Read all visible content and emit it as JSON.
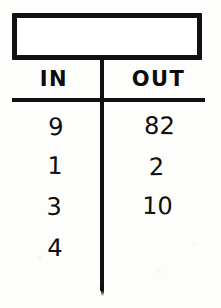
{
  "worksheet": {
    "kind": "in-out-function-table",
    "rule_box": {
      "name": "rule-box",
      "text": ""
    },
    "table": {
      "columns": [
        "IN",
        "OUT"
      ],
      "rows": [
        {
          "in": "9",
          "out": "82"
        },
        {
          "in": "1",
          "out": "2"
        },
        {
          "in": "3",
          "out": "10"
        },
        {
          "in": "4",
          "out": ""
        }
      ]
    },
    "colors": {
      "ink": "#111111",
      "paper": "#fdfdfc"
    }
  },
  "chart_data": {
    "type": "table",
    "title": "",
    "columns": [
      "IN",
      "OUT"
    ],
    "rows": [
      [
        "9",
        "82"
      ],
      [
        "1",
        "2"
      ],
      [
        "3",
        "10"
      ],
      [
        "4",
        ""
      ]
    ],
    "x": [
      9,
      1,
      3,
      4
    ],
    "series": [
      {
        "name": "OUT",
        "values": [
          82,
          2,
          10,
          null
        ]
      }
    ],
    "xlabel": "IN",
    "ylabel": "OUT",
    "annotations": []
  }
}
